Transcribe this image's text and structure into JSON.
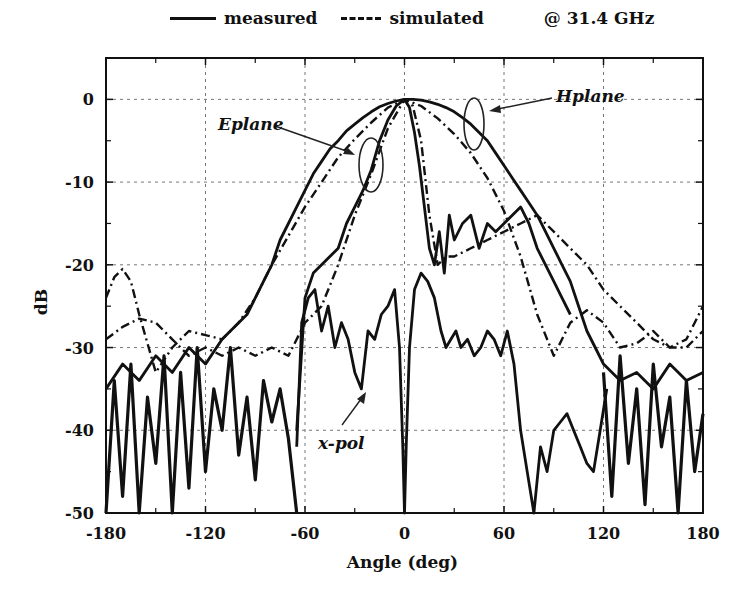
{
  "chart_data": {
    "type": "line",
    "title": "",
    "legend": {
      "position": "top",
      "entries": [
        {
          "label": "measured",
          "style": "solid"
        },
        {
          "label": "simulated",
          "style": "dash-dot"
        }
      ],
      "annotation": "@ 31.4 GHz"
    },
    "xlabel": "Angle (deg)",
    "ylabel": "dB",
    "xlim": [
      -180,
      180
    ],
    "ylim": [
      -50,
      5
    ],
    "xticks": [
      -180,
      -120,
      -60,
      0,
      60,
      120,
      180
    ],
    "yticks": [
      0,
      -10,
      -20,
      -30,
      -40,
      -50
    ],
    "grid": true,
    "annotations": [
      {
        "text": "Eplane",
        "x": -110,
        "y": -3.5,
        "points_to": [
          -20,
          -8
        ]
      },
      {
        "text": "Hplane",
        "x": 100,
        "y": -0.5,
        "points_to": [
          45,
          -3
        ]
      },
      {
        "text": "x-pol",
        "x": -40,
        "y": -42,
        "points_to": [
          -20,
          -35
        ]
      }
    ],
    "series": [
      {
        "name": "Hplane measured",
        "style": "solid",
        "x": [
          -180,
          -170,
          -160,
          -150,
          -140,
          -130,
          -120,
          -110,
          -105,
          -100,
          -95,
          -90,
          -85,
          -80,
          -75,
          -70,
          -65,
          -60,
          -55,
          -50,
          -45,
          -40,
          -35,
          -30,
          -25,
          -20,
          -15,
          -10,
          -5,
          0,
          5,
          10,
          15,
          20,
          25,
          30,
          35,
          40,
          45,
          50,
          55,
          60,
          65,
          70,
          75,
          80,
          85,
          90,
          95,
          100,
          105,
          110,
          115,
          120,
          130,
          140,
          150,
          160,
          170,
          180
        ],
        "y": [
          -35,
          -32,
          -34,
          -31,
          -33,
          -30,
          -32,
          -29,
          -28,
          -27,
          -26,
          -24,
          -22,
          -20,
          -17,
          -15,
          -13,
          -11,
          -9,
          -7.5,
          -6,
          -5,
          -3.8,
          -3,
          -2.2,
          -1.5,
          -0.9,
          -0.5,
          -0.2,
          0,
          0,
          -0.1,
          -0.3,
          -0.6,
          -1,
          -1.5,
          -2.2,
          -3,
          -4,
          -5,
          -6.5,
          -8,
          -9.5,
          -11,
          -12.5,
          -14,
          -16,
          -18,
          -20,
          -22,
          -25,
          -28,
          -30,
          -32,
          -34,
          -33,
          -35,
          -32,
          -34,
          -33
        ]
      },
      {
        "name": "Hplane simulated",
        "style": "dash-dot",
        "x": [
          -180,
          -175,
          -170,
          -165,
          -160,
          -150,
          -140,
          -130,
          -120,
          -110,
          -100,
          -90,
          -80,
          -70,
          -60,
          -50,
          -40,
          -30,
          -20,
          -10,
          0,
          10,
          20,
          30,
          40,
          50,
          60,
          70,
          80,
          90,
          100,
          110,
          120,
          130,
          140,
          150,
          160,
          170,
          175,
          180
        ],
        "y": [
          -24,
          -21.5,
          -20.5,
          -22,
          -26,
          -33,
          -30,
          -28,
          -28.5,
          -29,
          -27,
          -24,
          -20,
          -16.5,
          -13,
          -10,
          -7,
          -4.8,
          -2.8,
          -1,
          0,
          -0.8,
          -2.3,
          -4.2,
          -6.5,
          -9.5,
          -13.5,
          -19,
          -26,
          -31,
          -27,
          -25.5,
          -27,
          -30,
          -29.5,
          -28,
          -30,
          -29,
          -27,
          -25
        ]
      },
      {
        "name": "Eplane measured",
        "style": "solid",
        "x": [
          -65,
          -60,
          -55,
          -50,
          -45,
          -40,
          -35,
          -30,
          -25,
          -20,
          -15,
          -10,
          -5,
          0,
          3,
          6,
          9,
          12,
          15,
          18,
          21,
          24,
          27,
          30,
          35,
          40,
          45,
          50,
          55,
          60,
          65,
          70,
          75,
          80,
          85,
          90,
          95,
          100
        ],
        "y": [
          -40,
          -24,
          -21,
          -20,
          -19,
          -18,
          -15,
          -13,
          -11,
          -8.5,
          -5,
          -2.5,
          -0.8,
          0,
          -1,
          -4,
          -8,
          -13,
          -18,
          -20,
          -16,
          -21,
          -14,
          -17,
          -15,
          -14,
          -18,
          -15,
          -16,
          -15,
          -14,
          -13,
          -15,
          -18,
          -20,
          -22,
          -24,
          -26
        ]
      },
      {
        "name": "Eplane simulated",
        "style": "dash-dot",
        "x": [
          -180,
          -170,
          -160,
          -150,
          -140,
          -130,
          -120,
          -110,
          -100,
          -90,
          -80,
          -70,
          -60,
          -50,
          -40,
          -30,
          -20,
          -10,
          0,
          5,
          10,
          15,
          20,
          25,
          30,
          40,
          50,
          60,
          70,
          80,
          90,
          100,
          110,
          120,
          130,
          140,
          150,
          160,
          170,
          180
        ],
        "y": [
          -29,
          -27.5,
          -26.5,
          -27,
          -29,
          -31,
          -30,
          -31,
          -30,
          -31,
          -30,
          -31,
          -27,
          -25,
          -20,
          -14,
          -9,
          -3.5,
          0,
          -0.8,
          -5,
          -14,
          -20,
          -19,
          -19,
          -18,
          -17,
          -16,
          -15,
          -14,
          -16,
          -18,
          -20,
          -23,
          -25,
          -27,
          -29,
          -30,
          -30,
          -28
        ]
      },
      {
        "name": "x-pol measured",
        "style": "solid",
        "x": [
          -65,
          -62,
          -58,
          -54,
          -50,
          -46,
          -42,
          -38,
          -34,
          -30,
          -26,
          -22,
          -18,
          -14,
          -10,
          -6,
          -3,
          -1,
          0,
          1,
          3,
          6,
          10,
          14,
          18,
          22,
          25,
          28,
          31,
          34,
          38,
          42,
          46,
          50,
          54,
          58,
          62,
          66,
          70,
          74,
          78,
          82,
          86,
          90,
          94,
          98,
          102,
          106,
          110,
          114,
          118,
          122
        ],
        "y": [
          -42,
          -27,
          -24,
          -23,
          -28,
          -25,
          -30,
          -27,
          -29,
          -33,
          -35,
          -28,
          -29,
          -26,
          -25,
          -23,
          -30,
          -42,
          -50,
          -42,
          -30,
          -23,
          -21,
          -22,
          -24,
          -28,
          -30,
          -29,
          -28,
          -30,
          -29,
          -31,
          -30,
          -28,
          -29,
          -31,
          -28,
          -32,
          -40,
          -45,
          -50,
          -42,
          -45,
          -40,
          -39,
          -38,
          -40,
          -42,
          -44,
          -45,
          -40,
          -35
        ]
      },
      {
        "name": "sidelobe noise (measured)",
        "style": "solid",
        "x": [
          -180,
          -175,
          -170,
          -165,
          -160,
          -155,
          -150,
          -145,
          -140,
          -135,
          -130,
          -125,
          -120,
          -115,
          -110,
          -105,
          -100,
          -95,
          -90,
          -85,
          -80,
          -75,
          -70,
          -65,
          120,
          125,
          130,
          135,
          140,
          145,
          150,
          155,
          160,
          165,
          170,
          175,
          180
        ],
        "y": [
          -50,
          -34,
          -48,
          -32,
          -50,
          -36,
          -44,
          -31,
          -50,
          -33,
          -47,
          -30,
          -45,
          -35,
          -40,
          -30,
          -43,
          -36,
          -46,
          -34,
          -39,
          -35,
          -41,
          -50,
          -33,
          -48,
          -31,
          -44,
          -35,
          -49,
          -32,
          -42,
          -36,
          -50,
          -34,
          -45,
          -38
        ]
      }
    ]
  }
}
